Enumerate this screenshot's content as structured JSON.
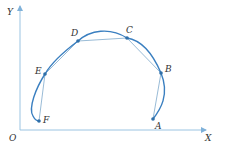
{
  "diagram": {
    "axes": {
      "x_label": "X",
      "y_label": "Y",
      "origin_label": "O"
    },
    "points": [
      {
        "id": "A",
        "label": "A",
        "x": 153,
        "y": 119
      },
      {
        "id": "B",
        "label": "B",
        "x": 161,
        "y": 73
      },
      {
        "id": "C",
        "label": "C",
        "x": 127,
        "y": 38
      },
      {
        "id": "D",
        "label": "D",
        "x": 78,
        "y": 41
      },
      {
        "id": "E",
        "label": "E",
        "x": 45,
        "y": 74
      },
      {
        "id": "F",
        "label": "F",
        "x": 39,
        "y": 121
      }
    ],
    "colors": {
      "curve": "#3a7fc0",
      "axis": "#9bc4e2",
      "chord": "#7fa9cc",
      "point": "#2f6fa8"
    }
  }
}
